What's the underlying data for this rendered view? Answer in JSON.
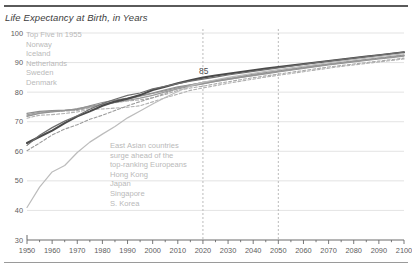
{
  "chart_data": {
    "type": "line",
    "title": "Life Expectancy at Birth, in Years",
    "xlabel": "",
    "ylabel": "",
    "xlim": [
      1950,
      2100
    ],
    "ylim": [
      30,
      100
    ],
    "xticks": [
      1950,
      1960,
      1970,
      1980,
      1990,
      2000,
      2010,
      2020,
      2030,
      2040,
      2050,
      2060,
      2070,
      2080,
      2090,
      2100
    ],
    "yticks": [
      30,
      40,
      50,
      60,
      70,
      80,
      90,
      100
    ],
    "minor_tick_interval": 5,
    "grid": "horizontal",
    "legend": "none",
    "reference_lines": [
      {
        "type": "vertical",
        "x": 2020,
        "style": "dashed"
      },
      {
        "type": "vertical",
        "x": 2050,
        "style": "dashed"
      }
    ],
    "annotations": [
      {
        "id": "value-85",
        "text": "85",
        "x": 2022,
        "y": 85.5
      },
      {
        "id": "europe-note",
        "x": 1952,
        "y": 99,
        "lines": [
          "Top Five in 1955",
          "Norway",
          "Iceland",
          "Netherlands",
          "Sweden",
          "Denmark"
        ]
      },
      {
        "id": "asia-note",
        "x": 1985,
        "y": 64,
        "lines": [
          "East Asian countries",
          "surge ahead of the",
          "top-ranking Europeans",
          "Hong Kong",
          "Japan",
          "Singapore",
          "S. Korea"
        ]
      }
    ],
    "x": [
      1950,
      1955,
      1960,
      1965,
      1970,
      1975,
      1980,
      1985,
      1990,
      1995,
      2000,
      2005,
      2010,
      2015,
      2020,
      2025,
      2030,
      2035,
      2040,
      2045,
      2050,
      2055,
      2060,
      2065,
      2070,
      2075,
      2080,
      2085,
      2090,
      2095,
      2100
    ],
    "series": [
      {
        "name": "Norway",
        "group": "europe",
        "color": "#9a9a9a",
        "style": "solid",
        "values": [
          72.3,
          73.2,
          73.6,
          73.8,
          74.1,
          74.9,
          75.8,
          76.5,
          77.2,
          78.0,
          78.9,
          80.1,
          81.1,
          82.0,
          82.8,
          83.6,
          84.3,
          85.0,
          85.7,
          86.4,
          87.0,
          87.6,
          88.2,
          88.8,
          89.4,
          89.9,
          90.4,
          90.9,
          91.4,
          91.9,
          92.4
        ]
      },
      {
        "name": "Iceland",
        "group": "europe",
        "color": "#8e8e8e",
        "style": "solid",
        "values": [
          72.8,
          73.5,
          73.8,
          73.9,
          74.2,
          75.4,
          76.5,
          77.3,
          78.0,
          78.8,
          79.7,
          80.8,
          81.8,
          82.5,
          83.2,
          83.9,
          84.6,
          85.3,
          86.0,
          86.6,
          87.2,
          87.8,
          88.4,
          89.0,
          89.5,
          90.0,
          90.5,
          91.0,
          91.5,
          92.0,
          92.5
        ]
      },
      {
        "name": "Netherlands",
        "group": "europe",
        "color": "#a8a8a8",
        "style": "dashed",
        "values": [
          72.0,
          73.0,
          73.4,
          73.6,
          73.8,
          74.7,
          75.7,
          76.4,
          77.0,
          77.4,
          78.1,
          79.2,
          80.6,
          81.4,
          82.0,
          82.8,
          83.5,
          84.2,
          84.9,
          85.5,
          86.1,
          86.7,
          87.3,
          87.9,
          88.5,
          89.0,
          89.5,
          90.0,
          90.5,
          91.0,
          91.5
        ]
      },
      {
        "name": "Sweden",
        "group": "europe",
        "color": "#949494",
        "style": "solid",
        "values": [
          71.8,
          72.8,
          73.3,
          73.7,
          74.4,
          75.2,
          76.0,
          76.8,
          77.6,
          78.6,
          79.6,
          80.5,
          81.5,
          82.2,
          82.9,
          83.6,
          84.3,
          85.0,
          85.6,
          86.2,
          86.8,
          87.4,
          88.0,
          88.6,
          89.2,
          89.7,
          90.2,
          90.7,
          91.2,
          91.7,
          92.2
        ]
      },
      {
        "name": "Denmark",
        "group": "europe",
        "color": "#b0b0b0",
        "style": "dashed",
        "values": [
          71.2,
          72.2,
          72.4,
          72.8,
          73.3,
          74.2,
          74.3,
          74.6,
          74.9,
          75.4,
          76.7,
          78.1,
          79.3,
          80.6,
          81.4,
          82.2,
          83.0,
          83.7,
          84.4,
          85.1,
          85.7,
          86.3,
          86.9,
          87.5,
          88.1,
          88.7,
          89.2,
          89.7,
          90.2,
          90.7,
          91.2
        ]
      },
      {
        "name": "Hong Kong",
        "group": "asia",
        "color": "#4a4a4a",
        "style": "solid-thick",
        "values": [
          62.8,
          64.9,
          67.0,
          69.5,
          71.8,
          73.5,
          75.4,
          76.8,
          77.8,
          79.0,
          80.7,
          81.8,
          83.0,
          84.0,
          84.9,
          85.6,
          86.2,
          86.8,
          87.4,
          88.0,
          88.5,
          89.0,
          89.5,
          90.0,
          90.5,
          91.0,
          91.5,
          92.0,
          92.5,
          93.0,
          93.5
        ]
      },
      {
        "name": "Japan",
        "group": "asia",
        "color": "#6e6e6e",
        "style": "solid",
        "values": [
          62.0,
          65.4,
          68.0,
          70.2,
          72.0,
          74.2,
          76.1,
          77.6,
          78.9,
          79.7,
          81.1,
          82.0,
          82.9,
          83.7,
          84.4,
          85.1,
          85.8,
          86.4,
          87.0,
          87.6,
          88.2,
          88.8,
          89.4,
          90.0,
          90.5,
          91.0,
          91.5,
          92.0,
          92.5,
          93.0,
          93.5
        ]
      },
      {
        "name": "Singapore",
        "group": "asia",
        "color": "#9c9c9c",
        "style": "dashed",
        "values": [
          60.2,
          62.8,
          65.5,
          67.5,
          69.0,
          70.8,
          72.2,
          73.8,
          75.4,
          76.8,
          78.1,
          79.6,
          81.3,
          82.5,
          83.3,
          84.0,
          84.7,
          85.4,
          86.0,
          86.6,
          87.2,
          87.8,
          88.4,
          89.0,
          89.5,
          90.0,
          90.5,
          91.0,
          91.5,
          92.0,
          92.5
        ]
      },
      {
        "name": "S. Korea",
        "group": "asia",
        "color": "#bcbcbc",
        "style": "solid",
        "values": [
          41.0,
          47.9,
          53.0,
          55.2,
          59.6,
          63.1,
          65.8,
          68.4,
          71.3,
          73.6,
          76.0,
          78.2,
          80.2,
          82.1,
          83.3,
          84.2,
          85.0,
          85.7,
          86.4,
          87.0,
          87.6,
          88.2,
          88.8,
          89.4,
          90.0,
          90.5,
          91.0,
          91.5,
          92.0,
          92.5,
          93.0
        ]
      }
    ]
  }
}
